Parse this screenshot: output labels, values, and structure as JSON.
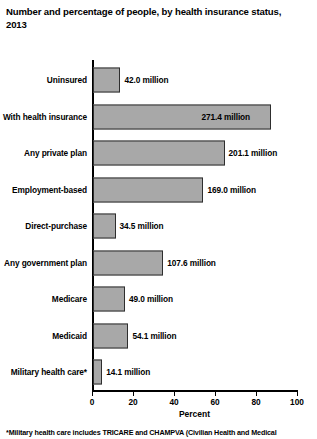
{
  "chart": {
    "title": "Number and percentage of people, by health insurance status,\n2013",
    "xlabel": "Percent",
    "footnote": "*Military health care includes TRICARE and CHAMPVA (Civilian Health and Medical"
  },
  "axis": {
    "ticks": [
      {
        "label": "0",
        "value": 0
      },
      {
        "label": "20",
        "value": 20
      },
      {
        "label": "40",
        "value": 40
      },
      {
        "label": "60",
        "value": 60
      },
      {
        "label": "80",
        "value": 80
      },
      {
        "label": "100",
        "value": 100
      }
    ]
  },
  "colors": {
    "bar_fill": "#a8a8a8",
    "bar_border": "#2e2e2e",
    "axis": "#000000",
    "text": "#000000",
    "background": "#ffffff"
  },
  "chart_data": {
    "type": "bar",
    "orientation": "horizontal",
    "title": "Number and percentage of people, by health insurance status, 2013",
    "xlabel": "Percent",
    "ylabel": "",
    "xlim": [
      0,
      100
    ],
    "grid": false,
    "legend": null,
    "categories": [
      "Uninsured",
      "With health insurance",
      "Any private plan",
      "Employment-based",
      "Direct-purchase",
      "Any government plan",
      "Medicare",
      "Medicaid",
      "Military health care*"
    ],
    "values": [
      13.4,
      86.6,
      64.2,
      53.9,
      11.0,
      34.3,
      15.6,
      17.3,
      4.5
    ],
    "data_labels": [
      "42.0 million",
      "271.4 million",
      "201.1 million",
      "169.0 million",
      "34.5 million",
      "107.6 million",
      "49.0 million",
      "54.1 million",
      "14.1 million"
    ],
    "counts_millions": [
      42.0,
      271.4,
      201.1,
      169.0,
      34.5,
      107.6,
      49.0,
      54.1,
      14.1
    ],
    "label_placement": [
      "outside",
      "inside",
      "outside",
      "outside",
      "outside",
      "outside",
      "outside",
      "outside",
      "outside"
    ]
  }
}
